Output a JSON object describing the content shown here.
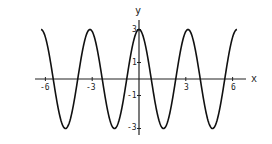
{
  "chart_data": {
    "type": "line",
    "title": "",
    "xlabel": "x",
    "ylabel": "y",
    "function": "y = 3cos(2x)",
    "xlim": [
      -6.28,
      6.28
    ],
    "ylim": [
      -3,
      3
    ],
    "xticks": [
      -6,
      -3,
      3,
      6
    ],
    "xtick_labels": [
      "-6",
      "-3",
      "3",
      "6"
    ],
    "yticks": [
      3,
      1,
      -1,
      -3
    ],
    "ytick_labels": [
      "3",
      "1",
      "-1",
      "-3"
    ],
    "grid": false,
    "legend": null,
    "series": [
      {
        "name": "3cos(2x)",
        "color": "#111111",
        "x": [
          -6.28,
          -4.71,
          -3.14,
          -1.57,
          0,
          1.57,
          3.14,
          4.71,
          6.28
        ],
        "values": [
          3,
          -3,
          3,
          -3,
          3,
          -3,
          3,
          -3,
          3
        ]
      }
    ]
  },
  "labels": {
    "x_axis": "x",
    "y_axis": "y",
    "xt": [
      "-6",
      "-3",
      "3",
      "6"
    ],
    "yt": [
      "3",
      "1",
      "-1",
      "-3"
    ]
  }
}
